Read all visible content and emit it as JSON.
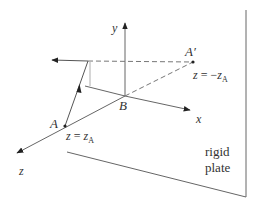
{
  "figure": {
    "type": "3d-coordinate-diagram",
    "axes": {
      "x_label": "x",
      "y_label": "y",
      "z_label": "z"
    },
    "points": {
      "A": {
        "label": "A",
        "condition_var": "z",
        "condition_eq": " = ",
        "condition_rhs": "z",
        "condition_sub": "A"
      },
      "A_prime": {
        "label": "A′",
        "condition_var": "z",
        "condition_eq": " = −",
        "condition_rhs": "z",
        "condition_sub": "A"
      },
      "B": {
        "label": "B"
      }
    },
    "plate": {
      "line1": "rigid",
      "line2": "plate"
    },
    "colors": {
      "stroke": "#555555",
      "text": "#333333",
      "background": "#ffffff"
    }
  }
}
